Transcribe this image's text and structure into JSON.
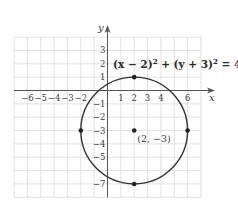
{
  "figure": {
    "equation": "(x − 2)² + (y + 3)² = 4²",
    "equation_parts": {
      "lhs1": "(x − 2)",
      "exp1": "2",
      "plus": " + (y + 3)",
      "exp2": "2",
      "rhs": " = 4",
      "exp3": "2"
    },
    "center_label": "(2, −3)",
    "x_axis_label": "x",
    "y_axis_label": "y",
    "x_ticks": [
      {
        "value": -6,
        "label": "−6"
      },
      {
        "value": -5,
        "label": "−5"
      },
      {
        "value": -4,
        "label": "−4"
      },
      {
        "value": -3,
        "label": "−3"
      },
      {
        "value": -2,
        "label": "−2"
      },
      {
        "value": 1,
        "label": "1"
      },
      {
        "value": 2,
        "label": "2"
      },
      {
        "value": 3,
        "label": "3"
      },
      {
        "value": 4,
        "label": "4"
      },
      {
        "value": 6,
        "label": "6"
      }
    ],
    "y_ticks": [
      {
        "value": 3,
        "label": "3"
      },
      {
        "value": 2,
        "label": "2"
      },
      {
        "value": 1,
        "label": "1"
      },
      {
        "value": -1,
        "label": "−1"
      },
      {
        "value": -2,
        "label": "−2"
      },
      {
        "value": -3,
        "label": "−3"
      },
      {
        "value": -4,
        "label": "−4"
      },
      {
        "value": -5,
        "label": "−5"
      },
      {
        "value": -7,
        "label": "−7"
      }
    ],
    "circle": {
      "cx": 2,
      "cy": -3,
      "r": 4
    },
    "points": [
      {
        "x": 2,
        "y": 1,
        "name": "top"
      },
      {
        "x": -2,
        "y": -3,
        "name": "left"
      },
      {
        "x": 2,
        "y": -3,
        "name": "center"
      },
      {
        "x": 6,
        "y": -3,
        "name": "right"
      },
      {
        "x": 2,
        "y": -7,
        "name": "bottom"
      }
    ],
    "grid": {
      "x_min": -7,
      "x_max": 7,
      "y_min": -8,
      "y_max": 4
    },
    "colors": {
      "grid": "#d9d9d9",
      "axis": "#555555",
      "curve": "#333333",
      "point": "#222222"
    }
  }
}
